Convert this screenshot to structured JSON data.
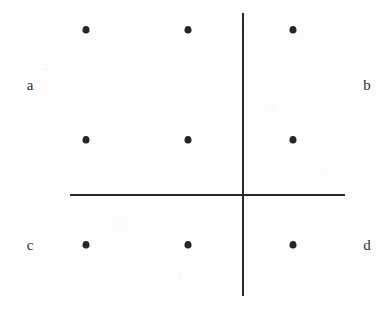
{
  "figure": {
    "background_color": "#fdfdfd",
    "ink_color": "#2a2a2a",
    "width": 384,
    "height": 315
  },
  "chart_data": {
    "type": "scatter",
    "title": "",
    "xlabel": "",
    "ylabel": "",
    "grid": false,
    "legend": null,
    "axis_origin": {
      "x": 242,
      "y": 194
    },
    "axes": [
      {
        "name": "vertical-axis",
        "orientation": "vertical",
        "x": 242,
        "y_start": 13,
        "y_end": 296,
        "thickness": 2
      },
      {
        "name": "horizontal-axis",
        "orientation": "horizontal",
        "y": 194,
        "x_start": 70,
        "x_end": 345,
        "thickness": 2
      }
    ],
    "columns_x": [
      86,
      188,
      293
    ],
    "rows_y": [
      30,
      140,
      245
    ],
    "points": [
      {
        "x": 86,
        "y": 30
      },
      {
        "x": 188,
        "y": 30
      },
      {
        "x": 293,
        "y": 30
      },
      {
        "x": 86,
        "y": 140
      },
      {
        "x": 188,
        "y": 140
      },
      {
        "x": 293,
        "y": 140
      },
      {
        "x": 86,
        "y": 245
      },
      {
        "x": 188,
        "y": 245
      },
      {
        "x": 293,
        "y": 245
      }
    ],
    "annotations": [
      {
        "name": "label-a",
        "text": "a",
        "x": 30,
        "y": 85
      },
      {
        "name": "label-b",
        "text": "b",
        "x": 367,
        "y": 85
      },
      {
        "name": "label-c",
        "text": "c",
        "x": 30,
        "y": 245
      },
      {
        "name": "label-d",
        "text": "d",
        "x": 367,
        "y": 245
      }
    ]
  }
}
